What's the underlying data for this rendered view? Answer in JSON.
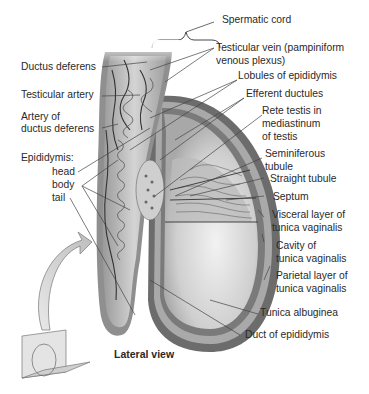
{
  "figure": {
    "view_label": "Lateral view",
    "labels": {
      "spermatic_cord": "Spermatic cord",
      "testicular_vein_1": "Testicular vein (pampiniform",
      "testicular_vein_2": "venous plexus)",
      "lobules_epididymis": "Lobules of epididymis",
      "efferent_ductules": "Efferent ductules",
      "rete_testis_1": "Rete testis in",
      "rete_testis_2": "mediastinum",
      "rete_testis_3": "of testis",
      "seminiferous_1": "Seminiferous",
      "seminiferous_2": "tubule",
      "straight_tubule": "Straight tubule",
      "septum": "Septum",
      "visceral_1": "Visceral layer of",
      "visceral_2": "tunica vaginalis",
      "cavity_1": "Cavity of",
      "cavity_2": "tunica vaginalis",
      "parietal_1": "Parietal layer of",
      "parietal_2": "tunica vaginalis",
      "tunica_albuginea": "Tunica albuginea",
      "duct_epididymis": "Duct of epididymis",
      "ductus_deferens": "Ductus deferens",
      "testicular_artery": "Testicular artery",
      "artery_ductus_1": "Artery of",
      "artery_ductus_2": "ductus deferens",
      "epididymis": "Epididymis:",
      "head": "head",
      "body": "body",
      "tail": "tail"
    }
  }
}
